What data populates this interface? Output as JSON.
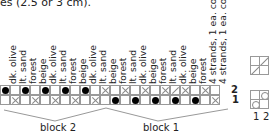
{
  "caption": "es (2.5 or 3 cm).",
  "columns": [
    "dk. olive",
    "lt. sand",
    "forest",
    "beige",
    "dk. olive",
    "lt. sand",
    "forest",
    "beige",
    "dk. olive",
    "lt. sand",
    "beige",
    "forest",
    "lt. sand",
    "dk. olive",
    "beige",
    "forest",
    "lt. sand",
    "dk. olive",
    "beige",
    "forest",
    "4 strands, 1 ea. color",
    "4 strands, 1 ea. color"
  ],
  "rows": {
    "row2": [
      "dot",
      "empty",
      "dot",
      "empty",
      "dot",
      "empty",
      "dot",
      "empty",
      "dot",
      "empty",
      "x",
      "empty",
      "x",
      "empty",
      "x",
      "empty",
      "x",
      "slash",
      "x",
      "empty",
      "x",
      "empty"
    ],
    "row1": [
      "empty",
      "x",
      "empty",
      "x",
      "empty",
      "x",
      "empty",
      "x",
      "empty",
      "x",
      "empty",
      "dot",
      "empty",
      "dot",
      "empty",
      "dot",
      "empty",
      "dot",
      "empty",
      "dot",
      "empty",
      "x"
    ]
  },
  "row_numbers": {
    "row2": "2",
    "row1": "1"
  },
  "blocks": [
    {
      "label": "block 2"
    },
    {
      "label": "block 1"
    }
  ],
  "legend": {
    "top_box": [
      "empty",
      "slash",
      "slash",
      "empty"
    ],
    "bottom_box": [
      "empty",
      "circle",
      "circle",
      "empty"
    ],
    "bottom_numbers": [
      "1",
      "2"
    ]
  }
}
